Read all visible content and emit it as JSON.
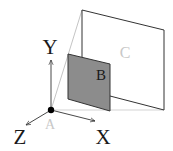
{
  "diagram": {
    "type": "3d-coordinate-planes",
    "axes": {
      "x_label": "X",
      "y_label": "Y",
      "z_label": "Z"
    },
    "origin": {
      "label": "A"
    },
    "planes": [
      {
        "id": "B",
        "label": "B",
        "fill": "#8c8c8c"
      },
      {
        "id": "C",
        "label": "C",
        "fill": "#ffffff"
      }
    ],
    "colors": {
      "stroke_dark": "#333333",
      "stroke_light": "#b5b5b5",
      "label_dark": "#1a1a1a",
      "label_light": "#c8c8c8",
      "plane_b_fill": "#8c8c8c",
      "origin_dot": "#000000"
    }
  }
}
